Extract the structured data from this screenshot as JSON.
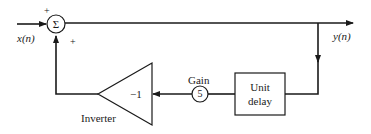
{
  "diagram": {
    "type": "block-diagram",
    "input": {
      "label": "x(n)"
    },
    "output": {
      "label": "y(n)"
    },
    "summer": {
      "symbol": "Σ",
      "sign_top": "+",
      "sign_bottom": "+"
    },
    "unit_delay": {
      "label_line1": "Unit",
      "label_line2": "delay"
    },
    "gain": {
      "title": "Gain",
      "value": "5"
    },
    "inverter": {
      "title": "Inverter",
      "value": "−1"
    },
    "colors": {
      "line": "#1a1a1a",
      "background": "#ffffff"
    }
  }
}
